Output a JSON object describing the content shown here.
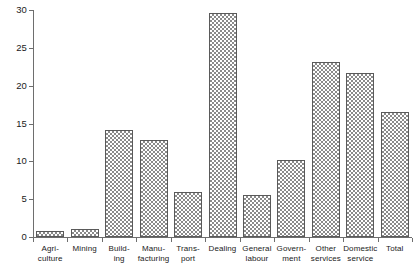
{
  "chart_data": {
    "type": "bar",
    "title": "",
    "subtitle": "",
    "xlabel": "",
    "ylabel": "",
    "ylim": [
      0,
      30
    ],
    "yticks": [
      0,
      5,
      10,
      15,
      20,
      25,
      30
    ],
    "ytick_labels": [
      "0",
      "5",
      "10",
      "15",
      "20",
      "25",
      "30"
    ],
    "grid": false,
    "legend": null,
    "bar_fill": "crosshatch",
    "categories": [
      "Agri-culture",
      "Mining",
      "Build-ing",
      "Manu-facturing",
      "Trans-port",
      "Dealing",
      "General labour",
      "Govern-ment",
      "Other services",
      "Domestic service",
      "Total"
    ],
    "category_lines": [
      [
        "Agri-",
        "culture"
      ],
      [
        "Mining",
        ""
      ],
      [
        "Build-",
        "ing"
      ],
      [
        "Manu-",
        "facturing"
      ],
      [
        "Trans-",
        "port"
      ],
      [
        "Dealing",
        ""
      ],
      [
        "General",
        "labour"
      ],
      [
        "Govern-",
        "ment"
      ],
      [
        "Other",
        "services"
      ],
      [
        "Domestic",
        "service"
      ],
      [
        "Total",
        ""
      ]
    ],
    "values": [
      0.8,
      1.0,
      14.2,
      12.8,
      5.9,
      29.6,
      5.5,
      10.2,
      23.1,
      21.7,
      16.5
    ]
  },
  "colors": {
    "axis": "#6e6e6e",
    "bar_outline": "#5a5a5a",
    "bar_hatch": "#8a8a8a",
    "text": "#1a1a1a",
    "background": "#ffffff"
  }
}
